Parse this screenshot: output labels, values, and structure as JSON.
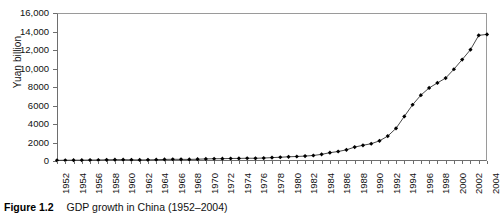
{
  "figure": {
    "caption_label": "Figure 1.2",
    "caption_text": "GDP growth in China (1952–2004)"
  },
  "chart_data": {
    "type": "line",
    "title": "",
    "xlabel": "",
    "ylabel": "Yuan billion",
    "ylim": [
      0,
      16000
    ],
    "xlim": [
      1952,
      2004
    ],
    "ytick_step": 2000,
    "ytick_labels": [
      "0",
      "2000",
      "4000",
      "6000",
      "8000",
      "10,000",
      "12,000",
      "14,000",
      "16,000"
    ],
    "ytick_values": [
      0,
      2000,
      4000,
      6000,
      8000,
      10000,
      12000,
      14000,
      16000
    ],
    "xtick_labels": [
      "1952",
      "1954",
      "1956",
      "1958",
      "1960",
      "1962",
      "1964",
      "1966",
      "1968",
      "1970",
      "1972",
      "1974",
      "1976",
      "1978",
      "1980",
      "1982",
      "1984",
      "1986",
      "1988",
      "1990",
      "1992",
      "1994",
      "1996",
      "1998",
      "2000",
      "2002",
      "2004"
    ],
    "xtick_label_step": 2,
    "xtick_minor_step": 1,
    "grid": false,
    "legend": false,
    "marker": "diamond",
    "marker_color": "#000000",
    "line_color": "#333333",
    "x": [
      1952,
      1953,
      1954,
      1955,
      1956,
      1957,
      1958,
      1959,
      1960,
      1961,
      1962,
      1963,
      1964,
      1965,
      1966,
      1967,
      1968,
      1969,
      1970,
      1971,
      1972,
      1973,
      1974,
      1975,
      1976,
      1977,
      1978,
      1979,
      1980,
      1981,
      1982,
      1983,
      1984,
      1985,
      1986,
      1987,
      1988,
      1989,
      1990,
      1991,
      1992,
      1993,
      1994,
      1995,
      1996,
      1997,
      1998,
      1999,
      2000,
      2001,
      2002,
      2003,
      2004
    ],
    "values": [
      68,
      82,
      86,
      91,
      103,
      107,
      131,
      144,
      145,
      122,
      115,
      123,
      145,
      172,
      187,
      177,
      172,
      194,
      225,
      243,
      252,
      272,
      279,
      300,
      294,
      321,
      365,
      406,
      455,
      489,
      532,
      597,
      717,
      897,
      1027,
      1206,
      1504,
      1700,
      1867,
      2180,
      2694,
      3533,
      4820,
      6079,
      7118,
      7897,
      8440,
      8968,
      9921,
      10966,
      12033,
      13582,
      13688
    ]
  }
}
